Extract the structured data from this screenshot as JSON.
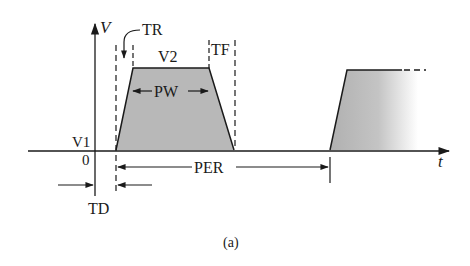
{
  "figure": {
    "caption": "(a)"
  },
  "axes": {
    "y_label": "V",
    "x_label": "t",
    "origin_label": "0"
  },
  "labels": {
    "v1": "V1",
    "v2": "V2",
    "tr": "TR",
    "tf": "TF",
    "pw": "PW",
    "per": "PER",
    "td": "TD"
  },
  "colors": {
    "line": "#1a1a1a",
    "fill": "#b8b8b8",
    "background": "#ffffff"
  }
}
